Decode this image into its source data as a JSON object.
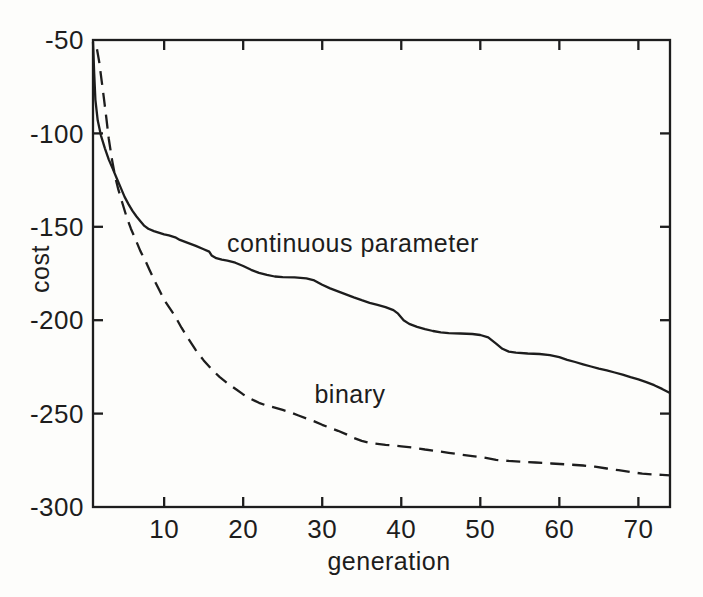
{
  "figure": {
    "background_color": "#fdfdfb",
    "ink_color": "#1d1d1d"
  },
  "chart_data": {
    "type": "line",
    "title": "",
    "xlabel": "generation",
    "ylabel": "cost",
    "xlim": [
      1,
      74
    ],
    "ylim": [
      -300,
      -50
    ],
    "x_ticks": [
      10,
      20,
      30,
      40,
      50,
      60,
      70
    ],
    "x_tick_labels": [
      "10",
      "20",
      "30",
      "40",
      "50",
      "60",
      "70"
    ],
    "y_ticks": [
      -50,
      -100,
      -150,
      -200,
      -250,
      -300
    ],
    "y_tick_labels": [
      "-50",
      "-100",
      "-150",
      "-200",
      "-250",
      "-300"
    ],
    "grid": false,
    "legend_position": "inline-annotations",
    "annotations": [
      {
        "text": "continuous parameter",
        "x": 33.9,
        "y": -159
      },
      {
        "text": "binary",
        "x": 33.5,
        "y": -240
      }
    ],
    "series": [
      {
        "name": "continuous parameter",
        "style": "solid",
        "points": [
          [
            1,
            -51
          ],
          [
            1.15,
            -68
          ],
          [
            1.3,
            -82
          ],
          [
            1.6,
            -93
          ],
          [
            2,
            -101
          ],
          [
            2.5,
            -108
          ],
          [
            3,
            -114
          ],
          [
            3.5,
            -119
          ],
          [
            4,
            -124
          ],
          [
            4.5,
            -129
          ],
          [
            5,
            -134
          ],
          [
            5.5,
            -138
          ],
          [
            6,
            -141.5
          ],
          [
            6.5,
            -144.5
          ],
          [
            7,
            -147
          ],
          [
            7.5,
            -149.5
          ],
          [
            8,
            -151
          ],
          [
            8.7,
            -152.3
          ],
          [
            9.4,
            -153.2
          ],
          [
            10,
            -154
          ],
          [
            10.6,
            -154.6
          ],
          [
            11.4,
            -155.6
          ],
          [
            12,
            -157
          ],
          [
            13,
            -158.6
          ],
          [
            14,
            -160.2
          ],
          [
            15,
            -162
          ],
          [
            15.7,
            -163.3
          ],
          [
            16,
            -165.3
          ],
          [
            16.6,
            -166.8
          ],
          [
            17.3,
            -167.6
          ],
          [
            18,
            -168.1
          ],
          [
            19,
            -169.2
          ],
          [
            20,
            -171
          ],
          [
            21,
            -173
          ],
          [
            22,
            -174.6
          ],
          [
            23,
            -175.7
          ],
          [
            24,
            -176.6
          ],
          [
            25,
            -177
          ],
          [
            26.5,
            -177.1
          ],
          [
            28,
            -177.6
          ],
          [
            29,
            -178.7
          ],
          [
            30,
            -181
          ],
          [
            31,
            -183
          ],
          [
            32,
            -184.6
          ],
          [
            33,
            -186.2
          ],
          [
            34,
            -187.8
          ],
          [
            35,
            -189.3
          ],
          [
            36,
            -190.7
          ],
          [
            37,
            -191.8
          ],
          [
            38,
            -193
          ],
          [
            39,
            -194.6
          ],
          [
            39.6,
            -196.5
          ],
          [
            40.3,
            -200
          ],
          [
            41,
            -202
          ],
          [
            42,
            -203.6
          ],
          [
            43,
            -204.8
          ],
          [
            44,
            -205.8
          ],
          [
            45,
            -206.5
          ],
          [
            46,
            -206.9
          ],
          [
            47.5,
            -207.1
          ],
          [
            49,
            -207.4
          ],
          [
            50,
            -207.9
          ],
          [
            51,
            -209.2
          ],
          [
            52,
            -212.5
          ],
          [
            52.8,
            -215.3
          ],
          [
            53.6,
            -216.8
          ],
          [
            54.5,
            -217.4
          ],
          [
            56,
            -217.8
          ],
          [
            57.5,
            -218.1
          ],
          [
            58.8,
            -218.7
          ],
          [
            60,
            -219.8
          ],
          [
            61,
            -221.2
          ],
          [
            62,
            -222.4
          ],
          [
            63,
            -223.6
          ],
          [
            64,
            -224.8
          ],
          [
            65,
            -225.9
          ],
          [
            66,
            -226.9
          ],
          [
            67,
            -228
          ],
          [
            68,
            -229.2
          ],
          [
            69,
            -230.5
          ],
          [
            70,
            -231.7
          ],
          [
            71,
            -233.2
          ],
          [
            72,
            -234.8
          ],
          [
            73,
            -236.8
          ],
          [
            74,
            -239
          ]
        ]
      },
      {
        "name": "binary",
        "style": "dashed",
        "points": [
          [
            1.5,
            -55
          ],
          [
            1.8,
            -62
          ],
          [
            2.1,
            -72
          ],
          [
            2.4,
            -82
          ],
          [
            2.7,
            -92
          ],
          [
            3,
            -103
          ],
          [
            3.4,
            -114
          ],
          [
            3.8,
            -123
          ],
          [
            4.2,
            -130
          ],
          [
            4.7,
            -137
          ],
          [
            5.2,
            -144
          ],
          [
            5.8,
            -151
          ],
          [
            6.4,
            -157
          ],
          [
            7,
            -163
          ],
          [
            7.6,
            -168
          ],
          [
            8.2,
            -173.5
          ],
          [
            8.8,
            -179
          ],
          [
            9.4,
            -184
          ],
          [
            10,
            -189
          ],
          [
            10.7,
            -193.5
          ],
          [
            11.4,
            -198
          ],
          [
            12.2,
            -204
          ],
          [
            13,
            -209.5
          ],
          [
            14,
            -216
          ],
          [
            15,
            -221.5
          ],
          [
            16,
            -226.3
          ],
          [
            17,
            -230.3
          ],
          [
            18,
            -233.7
          ],
          [
            19,
            -236.7
          ],
          [
            20,
            -239.7
          ],
          [
            21,
            -242.2
          ],
          [
            22,
            -244.2
          ],
          [
            23,
            -245.7
          ],
          [
            24,
            -246.8
          ],
          [
            25,
            -248
          ],
          [
            26,
            -249.4
          ],
          [
            27,
            -251
          ],
          [
            28,
            -252.6
          ],
          [
            29,
            -254.2
          ],
          [
            30,
            -256
          ],
          [
            31,
            -257.6
          ],
          [
            32,
            -259.2
          ],
          [
            33,
            -261
          ],
          [
            34,
            -263
          ],
          [
            35,
            -264.6
          ],
          [
            36,
            -265.7
          ],
          [
            37,
            -266.2
          ],
          [
            38,
            -266.7
          ],
          [
            39,
            -267.1
          ],
          [
            40,
            -267.5
          ],
          [
            41.5,
            -268.2
          ],
          [
            43,
            -269.2
          ],
          [
            44.5,
            -270.1
          ],
          [
            46,
            -271
          ],
          [
            47.5,
            -271.9
          ],
          [
            49,
            -272.8
          ],
          [
            50.5,
            -273.6
          ],
          [
            52,
            -274.8
          ],
          [
            53.5,
            -275.3
          ],
          [
            55,
            -275.7
          ],
          [
            57,
            -276.2
          ],
          [
            59,
            -276.7
          ],
          [
            61,
            -277.2
          ],
          [
            63,
            -277.8
          ],
          [
            64.5,
            -278.4
          ],
          [
            66,
            -279.4
          ],
          [
            67.5,
            -280.3
          ],
          [
            69,
            -281.3
          ],
          [
            70.5,
            -282.1
          ],
          [
            72,
            -282.6
          ],
          [
            73,
            -282.8
          ],
          [
            74,
            -283.1
          ]
        ]
      }
    ]
  }
}
